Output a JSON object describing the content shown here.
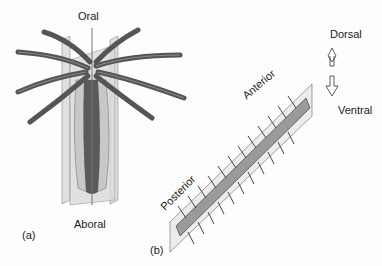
{
  "panel_a": {
    "tag": "(a)",
    "labels": {
      "top": "Oral",
      "bottom": "Aboral"
    },
    "subject": "radially symmetric animal with tentacles and intersecting symmetry planes"
  },
  "panel_b": {
    "tag": "(b)",
    "labels": {
      "head": "Anterior",
      "tail": "Posterior",
      "up": "Dorsal",
      "down": "Ventral"
    },
    "subject": "bilaterally symmetric segmented worm with sagittal plane"
  },
  "colors": {
    "tentacle": "#6d6d6d",
    "plane": "#d0d0d0",
    "body_dark": "#555555",
    "outline": "#333333"
  }
}
